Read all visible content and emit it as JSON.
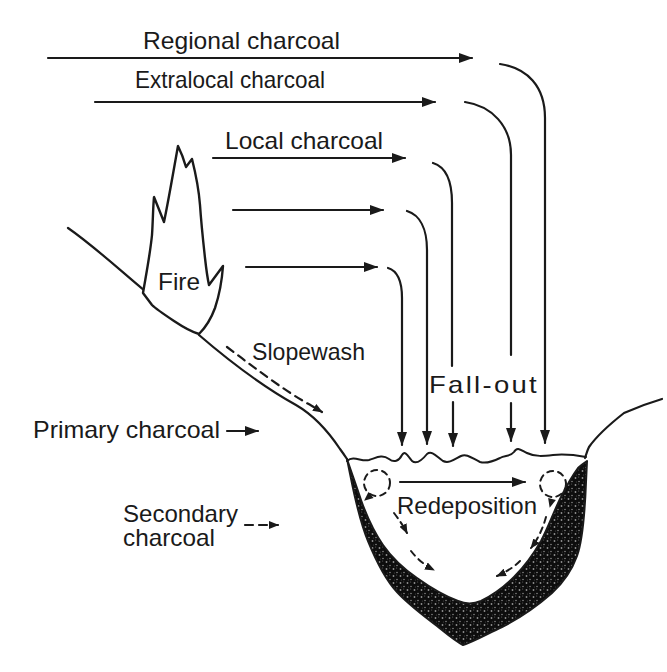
{
  "labels": {
    "regional": "Regional charcoal",
    "extralocal": "Extralocal charcoal",
    "local": "Local charcoal",
    "fire": "Fire",
    "slopewash": "Slopewash",
    "fallout": "Fall-out",
    "primary": "Primary charcoal",
    "secondary_line1": "Secondary",
    "secondary_line2": "charcoal",
    "redeposition": "Redeposition"
  },
  "colors": {
    "ink": "#1a1a1a",
    "paper": "#ffffff",
    "sediment_fill": "#0d0d0d"
  }
}
